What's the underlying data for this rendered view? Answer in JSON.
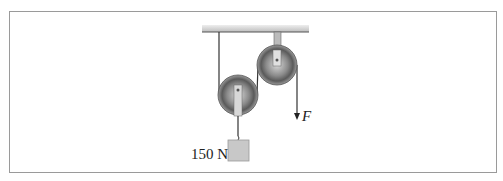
{
  "diagram": {
    "type": "pulley-system",
    "weight_label": "150 N",
    "force_label": "F",
    "colors": {
      "frame": "#9a9a9a",
      "rope": "#333333",
      "pulley": "#777777",
      "weight": "#c8c8c8"
    }
  }
}
